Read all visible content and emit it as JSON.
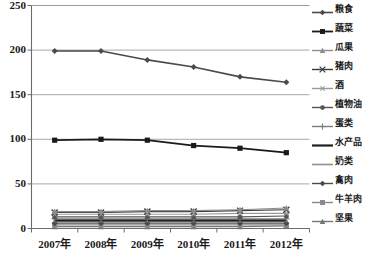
{
  "chart_data": {
    "type": "line",
    "title": "",
    "subtitle": "",
    "xlabel": "",
    "ylabel": "",
    "categories": [
      "2007年",
      "2008年",
      "2009年",
      "2010年",
      "2011年",
      "2012年"
    ],
    "ylim": [
      0,
      250
    ],
    "yticks": [
      0,
      50,
      100,
      150,
      200,
      250
    ],
    "ytick_labels": [
      "0",
      "50",
      "100",
      "150",
      "200",
      "250"
    ],
    "grid": "horizontal",
    "legend_position": "right",
    "series": [
      {
        "name": "粮食",
        "values": [
          199,
          199,
          189,
          181,
          170,
          164
        ],
        "color": "#4a4a4a",
        "marker": "diamond",
        "width": 1.6
      },
      {
        "name": "蔬菜",
        "values": [
          99,
          100,
          99,
          93,
          90,
          85
        ],
        "color": "#1a1a1a",
        "marker": "square",
        "width": 1.8
      },
      {
        "name": "瓜果",
        "values": [
          19,
          19,
          20,
          20,
          21,
          23
        ],
        "color": "#8c8c8c",
        "marker": "triangle",
        "width": 1.2
      },
      {
        "name": "猪肉",
        "values": [
          18,
          18,
          19,
          19,
          20,
          21
        ],
        "color": "#3a3a3a",
        "marker": "cross",
        "width": 1.2
      },
      {
        "name": "酒",
        "values": [
          16,
          16,
          16,
          16,
          17,
          17
        ],
        "color": "#9a9a9a",
        "marker": "star",
        "width": 1.1
      },
      {
        "name": "植物油",
        "values": [
          13,
          13,
          13,
          13,
          13,
          14
        ],
        "color": "#555555",
        "marker": "circle",
        "width": 1.2
      },
      {
        "name": "蛋类",
        "values": [
          11,
          11,
          11,
          11,
          11,
          11
        ],
        "color": "#7d7d7d",
        "marker": "plus",
        "width": 1.1
      },
      {
        "name": "水产品",
        "values": [
          9,
          9,
          9,
          9,
          9,
          9
        ],
        "color": "#202020",
        "marker": "none",
        "width": 2.2
      },
      {
        "name": "奶类",
        "values": [
          8,
          8,
          8,
          8,
          8,
          8
        ],
        "color": "#8f8f8f",
        "marker": "none",
        "width": 1.6
      },
      {
        "name": "禽肉",
        "values": [
          6,
          6,
          6,
          6,
          6,
          6
        ],
        "color": "#4a4a4a",
        "marker": "diamond",
        "width": 1.4
      },
      {
        "name": "牛羊肉",
        "values": [
          4,
          4,
          4,
          4,
          4,
          4
        ],
        "color": "#8a8a8a",
        "marker": "square",
        "width": 1.3
      },
      {
        "name": "坚果",
        "values": [
          2,
          2,
          2,
          2,
          2,
          3
        ],
        "color": "#767676",
        "marker": "triangle",
        "width": 1.3
      }
    ]
  },
  "style": {
    "background": "#ffffff",
    "grid_color": "#9e9e9e",
    "axis_color": "#6b6b6b",
    "text_color": "#1a1a1a"
  }
}
